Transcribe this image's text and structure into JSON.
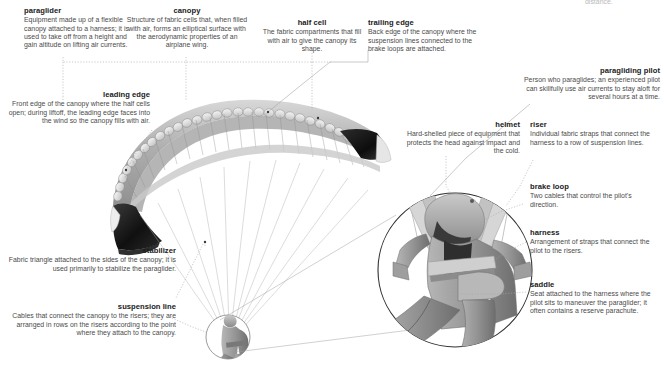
{
  "page": {
    "title": "paraglider",
    "cropped_top_text": "distance.",
    "background_color": "#ffffff",
    "text_color": "#2b2b2b",
    "leader_line_color": "#9a9a9a"
  },
  "callouts": [
    {
      "id": "paraglider",
      "title": "paraglider",
      "description": "Equipment made up of a flexible canopy attached to a harness; it is used to take off from a height and gain altitude on lifting air currents.",
      "align": "left"
    },
    {
      "id": "canopy",
      "title": "canopy",
      "description": "Structure of fabric cells that, when filled with air, forms an elliptical surface with the aerodynamic properties of an airplane wing.",
      "align": "center"
    },
    {
      "id": "half-cell",
      "title": "half cell",
      "description": "The fabric compartments that fill with air to give the canopy its shape.",
      "align": "center"
    },
    {
      "id": "trailing-edge",
      "title": "trailing edge",
      "description": "Back edge of the canopy where the suspension lines connected to the brake loops are attached.",
      "align": "left"
    },
    {
      "id": "paragliding-pilot",
      "title": "paragliding pilot",
      "description": "Person who paraglides; an experienced pilot can skillfully use air currents to stay aloft for several hours at a time.",
      "align": "right"
    },
    {
      "id": "leading-edge",
      "title": "leading edge",
      "description": "Front edge of the canopy where the half cells open; during liftoff, the leading edge faces into the wind so the canopy fills with air.",
      "align": "right"
    },
    {
      "id": "helmet",
      "title": "helmet",
      "description": "Hard-shelled piece of equipment that protects the head against impact and the cold.",
      "align": "right"
    },
    {
      "id": "riser",
      "title": "riser",
      "description": "Individual fabric straps that connect the harness to a row of suspension lines.",
      "align": "left"
    },
    {
      "id": "brake-loop",
      "title": "brake loop",
      "description": "Two cables that control the pilot's direction.",
      "align": "left"
    },
    {
      "id": "harness",
      "title": "harness",
      "description": "Arrangement of straps that connect the pilot to the risers.",
      "align": "left"
    },
    {
      "id": "saddle",
      "title": "saddle",
      "description": "Seat attached to the harness where the pilot sits to maneuver the paraglider; it often contains a reserve parachute.",
      "align": "left"
    },
    {
      "id": "stabilizer",
      "title": "stabilizer",
      "description": "Fabric triangle attached to the sides of the canopy; it is used primarily to stabilize the paraglider.",
      "align": "right"
    },
    {
      "id": "suspension-line",
      "title": "suspension line",
      "description": "Cables that connect the canopy to the risers; they are arranged in rows on the risers according to the point where they attach to the canopy.",
      "align": "right"
    }
  ],
  "illustration": {
    "canopy_body_color": "#b4b4b4",
    "canopy_tip_color": "#1c1c1c",
    "canopy_cell_color": "#e8e8e8",
    "pilot_suit_color": "#9a9a9a",
    "helmet_color": "#a8a8a8",
    "inset_circle_label": "magnified-pilot-detail",
    "small_circle_label": "pilot-detail-source"
  }
}
